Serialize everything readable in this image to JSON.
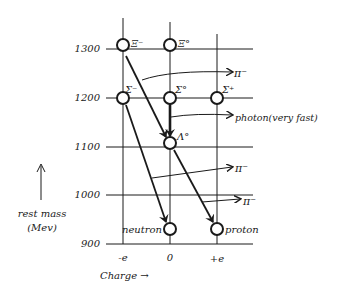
{
  "diagram": {
    "y_axis": {
      "label_line1": "rest mass",
      "label_line2": "(Mev)",
      "ticks": [
        "1300",
        "1200",
        "1100",
        "1000",
        "900"
      ]
    },
    "x_axis": {
      "label": "Charge →",
      "ticks": [
        "-e",
        "0",
        "+e"
      ]
    },
    "particles": [
      {
        "id": "xi-minus",
        "label": "Ξ⁻"
      },
      {
        "id": "xi-zero",
        "label": "Ξ°"
      },
      {
        "id": "sigma-minus",
        "label": "Σ⁻"
      },
      {
        "id": "sigma-zero",
        "label": "Σ°"
      },
      {
        "id": "sigma-plus",
        "label": "Σ⁺"
      },
      {
        "id": "lambda-zero",
        "label": "Λ°"
      },
      {
        "id": "neutron",
        "label": "neutron"
      },
      {
        "id": "proton",
        "label": "proton"
      }
    ],
    "emissions": [
      {
        "label": "π⁻"
      },
      {
        "label": "photon(very fast)"
      },
      {
        "label": "π⁻"
      },
      {
        "label": "π⁻"
      }
    ]
  }
}
